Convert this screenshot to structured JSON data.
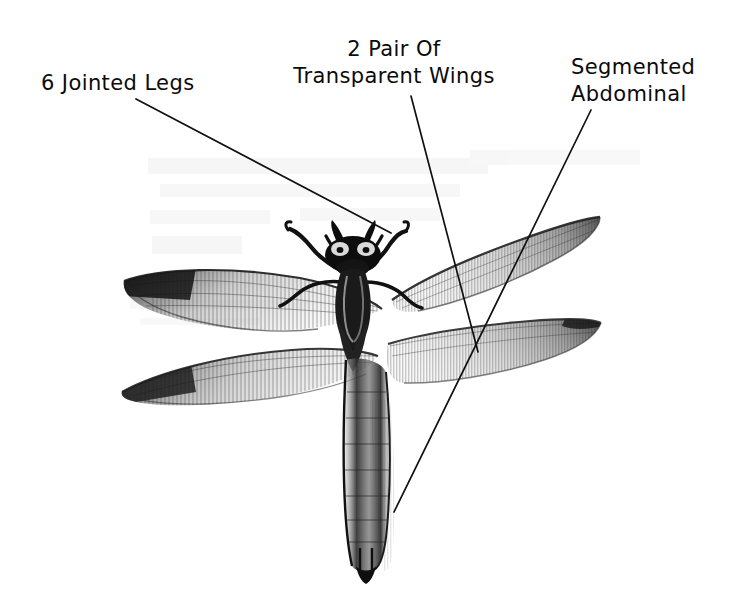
{
  "diagram": {
    "background_color": "#ffffff",
    "ink_color": "#111111",
    "style": "pencil-sketch-scan",
    "width": 730,
    "height": 597
  },
  "labels": [
    {
      "id": "legs",
      "name": "6 Jointed Legs",
      "lines": [
        "6 Jointed Legs"
      ],
      "text_x": 41,
      "text_y": 90,
      "anchor": "start",
      "leader": {
        "x1": 136,
        "y1": 99,
        "x2": 391,
        "y2": 233
      }
    },
    {
      "id": "wings",
      "name": "2 Pair Of Transparent Wings",
      "lines": [
        "2 Pair Of",
        "Transparent Wings"
      ],
      "text_x": 394,
      "text_y": 56,
      "anchor": "middle",
      "leader": {
        "x1": 411,
        "y1": 96,
        "x2": 478,
        "y2": 352
      }
    },
    {
      "id": "abdomen",
      "name": "Segmented Abdominal",
      "lines": [
        "Segmented",
        "Abdominal"
      ],
      "text_x": 571,
      "text_y": 74,
      "anchor": "start",
      "leader": {
        "x1": 591,
        "y1": 110,
        "x2": 394,
        "y2": 512
      }
    }
  ]
}
